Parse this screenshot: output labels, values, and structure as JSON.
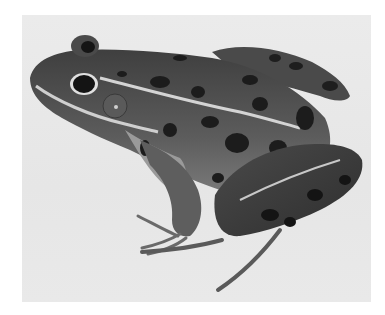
{
  "image": {
    "subject": "leopard frog",
    "style": "grayscale photograph",
    "colors": {
      "frame": "#ffffff",
      "background": "#e8e8e8",
      "body": "#5a5a5a",
      "spots": "#1e1e1e",
      "stripe": "#d8d8d8",
      "belly": "#a8a8a8"
    }
  }
}
